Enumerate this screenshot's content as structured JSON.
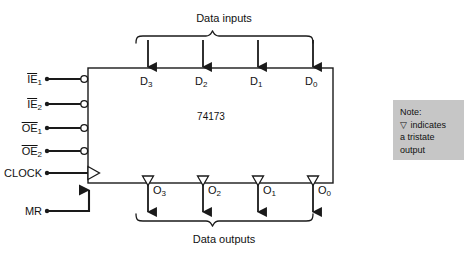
{
  "diagram": {
    "chip_label": "74173",
    "top_group_label": "Data inputs",
    "bottom_group_label": "Data outputs",
    "control_pins": [
      {
        "name": "IE1",
        "base": "IE",
        "subscript": "1",
        "overline": true,
        "inverting": true,
        "clock": false
      },
      {
        "name": "IE2",
        "base": "IE",
        "subscript": "2",
        "overline": true,
        "inverting": true,
        "clock": false
      },
      {
        "name": "OE1",
        "base": "OE",
        "subscript": "1",
        "overline": true,
        "inverting": true,
        "clock": false
      },
      {
        "name": "OE2",
        "base": "OE",
        "subscript": "2",
        "overline": true,
        "inverting": true,
        "clock": false
      },
      {
        "name": "CLOCK",
        "base": "CLOCK",
        "subscript": "",
        "overline": false,
        "inverting": false,
        "clock": true
      },
      {
        "name": "MR",
        "base": "MR",
        "subscript": "",
        "overline": false,
        "inverting": false,
        "clock": false
      }
    ],
    "data_inputs": [
      {
        "base": "D",
        "subscript": "3"
      },
      {
        "base": "D",
        "subscript": "2"
      },
      {
        "base": "D",
        "subscript": "1"
      },
      {
        "base": "D",
        "subscript": "0"
      }
    ],
    "data_outputs": [
      {
        "base": "O",
        "subscript": "3"
      },
      {
        "base": "O",
        "subscript": "2"
      },
      {
        "base": "O",
        "subscript": "1"
      },
      {
        "base": "O",
        "subscript": "0"
      }
    ],
    "note": {
      "title": "Note:",
      "glyph": "▽",
      "line1_text": "indicates",
      "line2": "a tristate",
      "line3": "output",
      "background_color": "#c6c6c6"
    },
    "bottom_caption": "",
    "colors": {
      "line": "#1a1a1a",
      "text": "#111111",
      "background": "#ffffff"
    }
  }
}
